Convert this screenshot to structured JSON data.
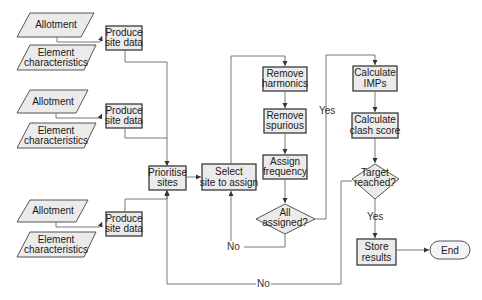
{
  "diagram": {
    "type": "flowchart",
    "inputs": [
      {
        "allotment": "Allotment",
        "element_1": "Element",
        "element_2": "characteristics",
        "process_1": "Produce",
        "process_2": "site data"
      },
      {
        "allotment": "Allotment",
        "element_1": "Element",
        "element_2": "characteristics",
        "process_1": "Produce",
        "process_2": "site data"
      },
      {
        "allotment": "Allotment",
        "element_1": "Element",
        "element_2": "characteristics",
        "process_1": "Produce",
        "process_2": "site data"
      }
    ],
    "nodes": {
      "prioritise": {
        "line1": "Prioritise",
        "line2": "sites"
      },
      "select": {
        "line1": "Select",
        "line2": "site to assign"
      },
      "harmonics": {
        "line1": "Remove",
        "line2": "harmonics"
      },
      "spurious": {
        "line1": "Remove",
        "line2": "spurious"
      },
      "assign": {
        "line1": "Assign",
        "line2": "frequency"
      },
      "all_assigned": {
        "line1": "All",
        "line2": "assigned?"
      },
      "imps": {
        "line1": "Calculate",
        "line2": "IMPs"
      },
      "clash": {
        "line1": "Calculate",
        "line2": "clash score"
      },
      "target": {
        "line1": "Target",
        "line2": "reached?"
      },
      "store": {
        "line1": "Store",
        "line2": "results"
      },
      "end": {
        "label": "End"
      }
    },
    "edge_labels": {
      "all_assigned_yes": "Yes",
      "all_assigned_no": "No",
      "target_yes": "Yes",
      "target_no": "No"
    },
    "colors": {
      "box_fill": "#ebebeb",
      "box_stroke": "#3a3a3a",
      "line": "#6a6a6a"
    }
  }
}
